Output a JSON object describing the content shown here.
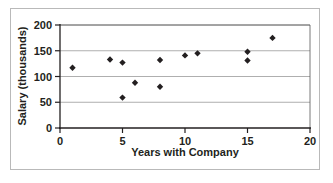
{
  "chart_data": {
    "type": "scatter",
    "title": "",
    "xlabel": "Years with Company",
    "ylabel": "Salary (thousands)",
    "xlim": [
      0,
      20
    ],
    "ylim": [
      0,
      200
    ],
    "xticks": [
      0,
      5,
      10,
      15,
      20
    ],
    "yticks": [
      0,
      50,
      100,
      150,
      200
    ],
    "xtick_labels": [
      "0",
      "5",
      "10",
      "15",
      "20"
    ],
    "ytick_labels": [
      "0",
      "50",
      "100",
      "150",
      "200"
    ],
    "grid": "horizontal",
    "legend": "none",
    "marker": "diamond",
    "marker_color": "#231f20",
    "points": [
      {
        "x": 1,
        "y": 117
      },
      {
        "x": 4,
        "y": 133
      },
      {
        "x": 5,
        "y": 127
      },
      {
        "x": 5,
        "y": 59
      },
      {
        "x": 6,
        "y": 88
      },
      {
        "x": 8,
        "y": 132
      },
      {
        "x": 8,
        "y": 80
      },
      {
        "x": 10,
        "y": 141
      },
      {
        "x": 11,
        "y": 145
      },
      {
        "x": 15,
        "y": 148
      },
      {
        "x": 15,
        "y": 131
      },
      {
        "x": 17,
        "y": 175
      }
    ]
  }
}
